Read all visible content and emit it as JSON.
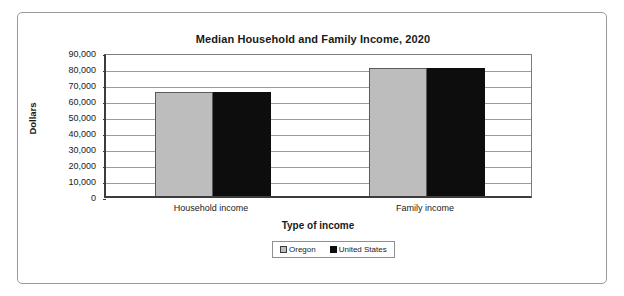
{
  "chart_data": {
    "type": "bar",
    "title": "Median Household and Family Income, 2020",
    "xlabel": "Type of income",
    "ylabel": "Dollars",
    "categories": [
      "Household income",
      "Family income"
    ],
    "series": [
      {
        "name": "Oregon",
        "color": "#bdbdbd",
        "values": [
          65000,
          80000
        ]
      },
      {
        "name": "United States",
        "color": "#0d0d0d",
        "values": [
          65000,
          80000
        ]
      }
    ],
    "ylim": [
      0,
      90000
    ],
    "ytick_labels": [
      "90,000",
      "80,000",
      "70,000",
      "60,000",
      "50,000",
      "40,000",
      "30,000",
      "20,000",
      "10,000",
      "0"
    ],
    "ytick_values": [
      90000,
      80000,
      70000,
      60000,
      50000,
      40000,
      30000,
      20000,
      10000,
      0
    ],
    "grid": "horizontal",
    "legend_position": "bottom-center"
  },
  "legend": {
    "entries": [
      {
        "label": "Oregon",
        "swatch": "legend-swatch-oregon"
      },
      {
        "label": "United States",
        "swatch": "legend-swatch-united-states"
      }
    ]
  }
}
